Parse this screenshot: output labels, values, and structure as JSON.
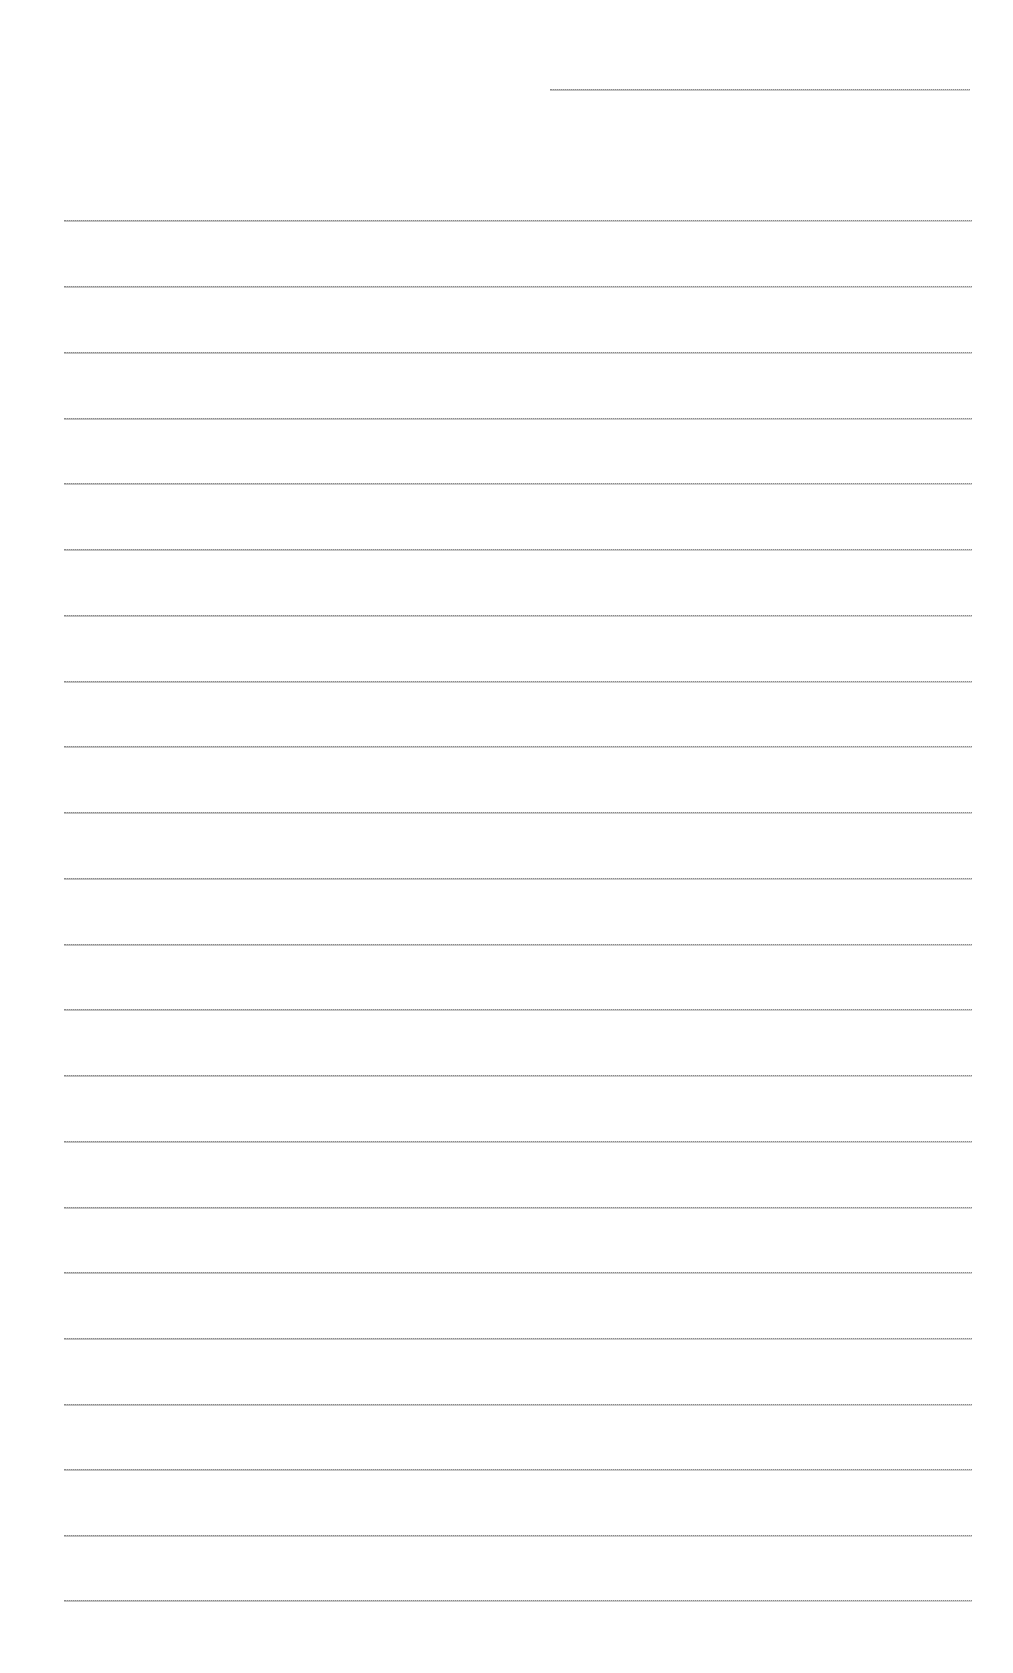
{
  "page": {
    "type": "blank lined sheet",
    "background_color": "#ffffff",
    "rule_color": "#8a8a8a",
    "header_rule": {
      "x1": 550,
      "x2": 970,
      "y": 89
    },
    "body_rules": {
      "x1": 64,
      "x2": 972,
      "y_positions": [
        220,
        286,
        352,
        418,
        483,
        549,
        615,
        681,
        746,
        812,
        878,
        944,
        1009,
        1075,
        1141,
        1207,
        1272,
        1338,
        1404,
        1469,
        1535,
        1600
      ]
    }
  }
}
